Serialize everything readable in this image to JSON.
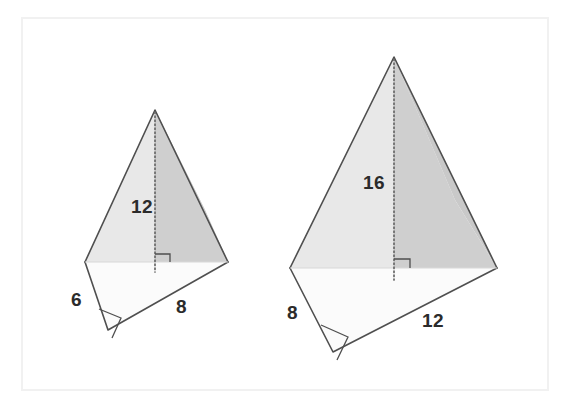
{
  "figure": {
    "background_color": "#ffffff",
    "border_color": "#f2f2f2",
    "edge_color": "#4a4a4a",
    "dotted_line_color": "#6e6e6e",
    "label_color": "#2b2b2b",
    "face_shade_dark": "#c9c9c9",
    "face_shade_mid": "#dcdcdc",
    "face_shade_light": "#efefef",
    "face_shade_base": "#fbfbfb"
  },
  "pyramids": [
    {
      "name": "left-pyramid",
      "height_label": "12",
      "base_front_left_label": "6",
      "base_front_right_label": "8",
      "right_angle_marks": 2
    },
    {
      "name": "right-pyramid",
      "height_label": "16",
      "base_front_left_label": "8",
      "base_front_right_label": "12",
      "right_angle_marks": 2
    }
  ],
  "labels": {
    "left_height": "12",
    "left_side_a": "6",
    "left_side_b": "8",
    "right_height": "16",
    "right_side_a": "8",
    "right_side_b": "12"
  }
}
